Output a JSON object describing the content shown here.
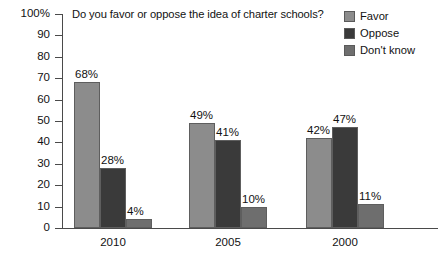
{
  "chart_data": {
    "type": "bar",
    "title": "Do you favor or oppose the idea of charter schools?",
    "xlabel": "",
    "ylabel": "",
    "ylim": [
      0,
      100
    ],
    "grid": false,
    "legend_position": "top-right",
    "categories": [
      "2010",
      "2005",
      "2000"
    ],
    "series": [
      {
        "name": "Favor",
        "color": "#8c8c8c",
        "values": [
          68,
          49,
          42
        ],
        "labels": [
          "68%",
          "49%",
          "42%"
        ]
      },
      {
        "name": "Oppose",
        "color": "#3a3a3a",
        "values": [
          28,
          41,
          47
        ],
        "labels": [
          "28%",
          "41%",
          "47%"
        ]
      },
      {
        "name": "Don't know",
        "color": "#6e6e6e",
        "values": [
          4,
          10,
          11
        ],
        "labels": [
          "4%",
          "10%",
          "11%"
        ]
      }
    ],
    "ytick_labels": [
      "100%",
      "90",
      "80",
      "70",
      "60",
      "50",
      "40",
      "30",
      "20",
      "10",
      "0"
    ],
    "ytick_values": [
      100,
      90,
      80,
      70,
      60,
      50,
      40,
      30,
      20,
      10,
      0
    ]
  },
  "legend": {
    "items": [
      {
        "label": "Favor",
        "color": "#8c8c8c"
      },
      {
        "label": "Oppose",
        "color": "#3a3a3a"
      },
      {
        "label": "Don't know",
        "color": "#6e6e6e"
      }
    ]
  }
}
